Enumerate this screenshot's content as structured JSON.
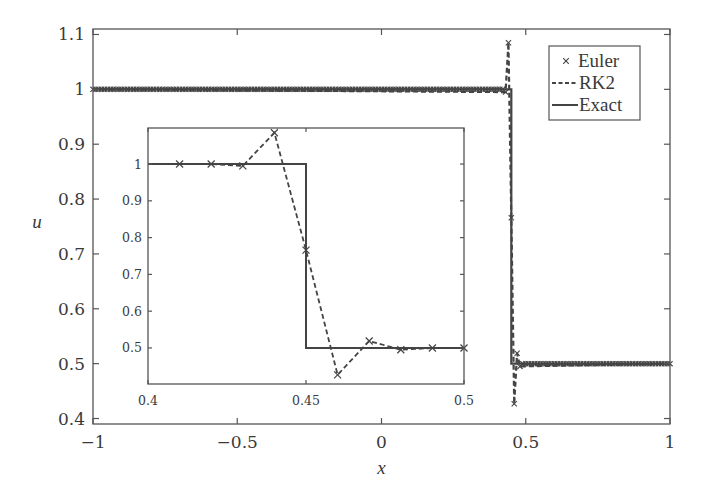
{
  "chart_data": [
    {
      "id": "main",
      "type": "line",
      "title": "",
      "xlabel": "x",
      "ylabel": "u",
      "xlim": [
        -1,
        1
      ],
      "ylim": [
        0.39,
        1.11
      ],
      "xticks": [
        -1,
        -0.5,
        0,
        0.5,
        1
      ],
      "xtick_labels": [
        "−1",
        "−0.5",
        "0",
        "0.5",
        "1"
      ],
      "yticks": [
        0.4,
        0.5,
        0.6,
        0.7,
        0.8,
        0.9,
        1.0,
        1.1
      ],
      "ytick_labels": [
        "0.4",
        "0.5",
        "0.6",
        "0.7",
        "0.8",
        "0.9",
        "1",
        "1.1"
      ],
      "grid": false,
      "legend": {
        "position": "top-right",
        "entries": [
          {
            "label": "Euler",
            "style": "marker-x"
          },
          {
            "label": "RK2",
            "style": "dashed"
          },
          {
            "label": "Exact",
            "style": "solid"
          }
        ]
      },
      "series": [
        {
          "name": "Exact",
          "style": "solid",
          "x": [
            -1,
            0.45,
            0.45,
            1
          ],
          "y": [
            1,
            1,
            0.5,
            0.5
          ]
        },
        {
          "name": "RK2",
          "style": "dashed",
          "x": [
            -1,
            0.43,
            0.44,
            0.45,
            0.46,
            0.47,
            0.48,
            1
          ],
          "y": [
            1,
            0.995,
            1.085,
            0.766,
            0.427,
            0.519,
            0.495,
            0.5
          ]
        },
        {
          "name": "Euler",
          "style": "marker-x",
          "x_step": 0.01,
          "x_range": [
            -1,
            1
          ],
          "overrides": {
            "0.43": 0.995,
            "0.44": 1.085,
            "0.45": 0.766,
            "0.46": 0.427,
            "0.47": 0.519,
            "0.48": 0.495
          },
          "pre_shock_value": 1,
          "post_shock_value": 0.5,
          "shock_x": 0.45
        }
      ]
    },
    {
      "id": "inset",
      "type": "line",
      "title": "",
      "xlabel": "",
      "ylabel": "",
      "xlim": [
        0.4,
        0.5
      ],
      "ylim": [
        0.402,
        1.098
      ],
      "xticks": [
        0.4,
        0.45,
        0.5
      ],
      "xtick_labels": [
        "0.4",
        "0.45",
        "0.5"
      ],
      "yticks": [
        0.5,
        0.6,
        0.7,
        0.8,
        0.9,
        1.0
      ],
      "ytick_labels": [
        "0.5",
        "0.6",
        "0.7",
        "0.8",
        "0.9",
        "1"
      ],
      "grid": false,
      "series": [
        {
          "name": "Exact",
          "style": "solid",
          "x": [
            0.4,
            0.45,
            0.45,
            0.5
          ],
          "y": [
            1,
            1,
            0.5,
            0.5
          ]
        },
        {
          "name": "RK2",
          "style": "dashed",
          "x": [
            0.4,
            0.41,
            0.42,
            0.43,
            0.44,
            0.45,
            0.46,
            0.47,
            0.48,
            0.49,
            0.5
          ],
          "y": [
            1,
            1,
            1,
            0.995,
            1.085,
            0.766,
            0.427,
            0.519,
            0.495,
            0.5,
            0.5
          ]
        },
        {
          "name": "Euler",
          "style": "marker-x",
          "x": [
            0.41,
            0.42,
            0.43,
            0.44,
            0.45,
            0.46,
            0.47,
            0.48,
            0.49,
            0.5
          ],
          "y": [
            1,
            1,
            0.995,
            1.085,
            0.766,
            0.427,
            0.519,
            0.495,
            0.5,
            0.5
          ]
        }
      ]
    }
  ]
}
